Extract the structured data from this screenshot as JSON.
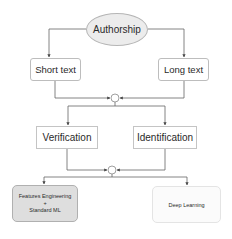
{
  "diagram": {
    "root": {
      "label": "Authorship"
    },
    "level1": [
      {
        "label": "Short text"
      },
      {
        "label": "Long text"
      }
    ],
    "level2": [
      {
        "label": "Verification"
      },
      {
        "label": "Identification"
      }
    ],
    "level3": [
      {
        "line1": "Features Engineering",
        "line2": "+",
        "line3": "Standard ML"
      },
      {
        "label": "Deep Learning"
      }
    ],
    "colors": {
      "line": "#555555",
      "ellipse_fill": "#ececec",
      "gray_box_fill": "#dedede",
      "light_box_fill": "#fbfbfb"
    }
  }
}
